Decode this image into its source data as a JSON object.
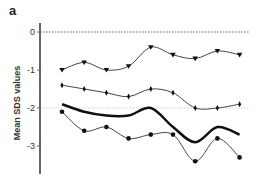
{
  "panel_label": "a",
  "chart_data": {
    "type": "line",
    "title": "",
    "xlabel": "",
    "ylabel": "Mean SDS values",
    "ylim": [
      -3.7,
      0.4
    ],
    "yticks": [
      0,
      -1,
      -2,
      -3
    ],
    "ytick_labels": [
      "0",
      "-1",
      "-2",
      "-3"
    ],
    "reference_lines": [
      {
        "y": 0,
        "style": "dotted",
        "color": "#555555"
      },
      {
        "y": -2,
        "style": "dotted",
        "color": "#cccccc"
      }
    ],
    "x": [
      1,
      2,
      3,
      4,
      5,
      6,
      7,
      8,
      9
    ],
    "series": [
      {
        "name": "triangle-series",
        "marker": "triangle-down",
        "line_width": 1,
        "values": [
          -1.0,
          -0.8,
          -1.0,
          -0.9,
          -0.4,
          -0.6,
          -0.7,
          -0.5,
          -0.6
        ]
      },
      {
        "name": "diamond-series",
        "marker": "diamond",
        "line_width": 1,
        "values": [
          -1.4,
          -1.5,
          -1.6,
          -1.7,
          -1.5,
          -1.6,
          -2.0,
          -2.0,
          -1.9
        ]
      },
      {
        "name": "mean-series",
        "marker": "none",
        "line_width": 2.5,
        "values": [
          -1.9,
          -2.1,
          -2.2,
          -2.2,
          -2.0,
          -2.5,
          -2.9,
          -2.5,
          -2.7
        ]
      },
      {
        "name": "circle-series",
        "marker": "circle",
        "line_width": 1,
        "values": [
          -2.1,
          -2.6,
          -2.5,
          -2.8,
          -2.7,
          -2.7,
          -3.4,
          -2.8,
          -3.3
        ]
      }
    ],
    "grid": false,
    "legend": null
  }
}
